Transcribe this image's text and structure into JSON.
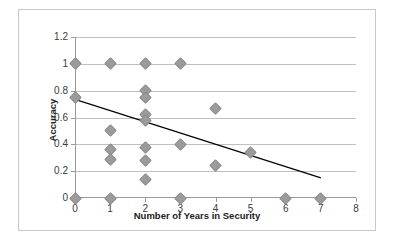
{
  "chart_data": {
    "type": "scatter",
    "title": "",
    "xlabel": "Number of Years in Security",
    "ylabel": "Accuracy",
    "xlim": [
      0,
      8
    ],
    "ylim": [
      0,
      1.2
    ],
    "grid": true,
    "legend": false,
    "marker_color": "#9b9b9b",
    "trendline_color": "#000000",
    "gridline_color": "#c0c0c0",
    "border_color": "#c9c9c9",
    "x_ticks": [
      "0",
      "1",
      "2",
      "3",
      "4",
      "5",
      "6",
      "7",
      "8"
    ],
    "x_tick_values": [
      0,
      1,
      2,
      3,
      4,
      5,
      6,
      7,
      8
    ],
    "y_ticks": [
      "0",
      "0.2",
      "0.4",
      "0.6",
      "0.8",
      "1",
      "1.2"
    ],
    "y_tick_values": [
      0,
      0.2,
      0.4,
      0.6,
      0.8,
      1,
      1.2
    ],
    "points": [
      {
        "x": 0,
        "y": 1.0
      },
      {
        "x": 0,
        "y": 0.75
      },
      {
        "x": 0,
        "y": 0.0
      },
      {
        "x": 1,
        "y": 1.0
      },
      {
        "x": 1,
        "y": 0.5
      },
      {
        "x": 1,
        "y": 0.36
      },
      {
        "x": 1,
        "y": 0.29
      },
      {
        "x": 1,
        "y": 0.0
      },
      {
        "x": 2,
        "y": 1.0
      },
      {
        "x": 2,
        "y": 0.8
      },
      {
        "x": 2,
        "y": 0.75
      },
      {
        "x": 2,
        "y": 0.62
      },
      {
        "x": 2,
        "y": 0.58
      },
      {
        "x": 2,
        "y": 0.375
      },
      {
        "x": 2,
        "y": 0.28
      },
      {
        "x": 2,
        "y": 0.14
      },
      {
        "x": 3,
        "y": 1.0
      },
      {
        "x": 3,
        "y": 0.4
      },
      {
        "x": 3,
        "y": 0.0
      },
      {
        "x": 4,
        "y": 0.67
      },
      {
        "x": 4,
        "y": 0.24
      },
      {
        "x": 5,
        "y": 0.34
      },
      {
        "x": 6,
        "y": 0.0
      },
      {
        "x": 7,
        "y": 0.0
      }
    ],
    "trendline": {
      "type": "linear",
      "x_start": 0,
      "y_start": 0.735,
      "x_end": 7,
      "y_end": 0.15
    }
  }
}
